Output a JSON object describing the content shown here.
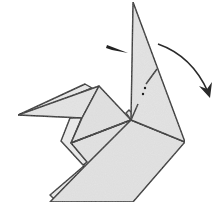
{
  "diagram": {
    "subject": "origami crane/bird fold step",
    "caption": "",
    "colors": {
      "paper_fill": "#e4e4e4",
      "paper_fill_light": "#ededed",
      "line": "#1c1c1c",
      "arrow": "#2a2a2a",
      "background": "#ffffff"
    },
    "symbols": [
      {
        "name": "push-in-arrow",
        "meaning": "indicates pressing / sink point on neck"
      },
      {
        "name": "fold-direction-arrow",
        "meaning": "curved arrow showing neck folding down to the right"
      },
      {
        "name": "fold-line-dots",
        "meaning": "dotted valley-fold line on neck"
      }
    ]
  }
}
